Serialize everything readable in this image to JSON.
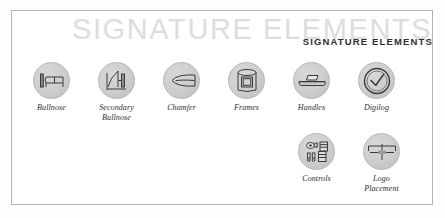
{
  "page": {
    "watermark_text": "SIGNATURE ELEMENTS",
    "heading_text": "SIGNATURE ELEMENTS",
    "frame_color": "#b4b4b4",
    "watermark_color": "#dddddd",
    "heading_color": "#2e2e2e",
    "disc_color": "#cdcdcd",
    "label_color": "#2c2c2c"
  },
  "rows": [
    {
      "name": "primary-elements-row",
      "items": [
        {
          "label": "Bullnose",
          "icon": "bullnose-icon"
        },
        {
          "label": "Secondary\nBullnose",
          "icon": "secondary-bullnose-icon"
        },
        {
          "label": "Chamfer",
          "icon": "chamfer-icon"
        },
        {
          "label": "Frames",
          "icon": "frames-icon"
        },
        {
          "label": "Handles",
          "icon": "handles-icon"
        },
        {
          "label": "Digilog",
          "icon": "digilog-icon"
        }
      ]
    },
    {
      "name": "secondary-elements-row",
      "items": [
        {
          "label": "Controls",
          "icon": "controls-icon"
        },
        {
          "label": "Logo\nPlacement",
          "icon": "logo-placement-icon"
        }
      ]
    }
  ]
}
